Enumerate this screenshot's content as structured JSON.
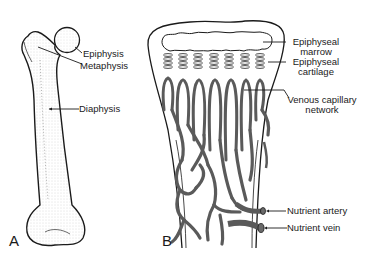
{
  "figure": {
    "panels": [
      {
        "id": "A",
        "letter": "A",
        "subject": "femur",
        "labels": [
          {
            "text": "Epiphysis"
          },
          {
            "text": "Metaphysis"
          },
          {
            "text": "Diaphysis"
          }
        ]
      },
      {
        "id": "B",
        "letter": "B",
        "subject": "bone end vasculature",
        "labels": [
          {
            "line1": "Epiphyseal",
            "line2": "marrow"
          },
          {
            "line1": "Epiphyseal",
            "line2": "cartilage"
          },
          {
            "line1": "Venous capillary",
            "line2": "network"
          },
          {
            "text": "Nutrient artery"
          },
          {
            "text": "Nutrient vein"
          }
        ]
      }
    ],
    "colors": {
      "line": "#1a1a1a",
      "vessel": "#6a6a6a",
      "background": "#ffffff"
    }
  }
}
